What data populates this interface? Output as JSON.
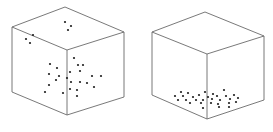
{
  "figure": {
    "background": "#ffffff",
    "edge_color": "#6a6a6a",
    "dot_color": "#1e1e1e",
    "dot_radius": 1.1,
    "panels": [
      {
        "id": "dispersed",
        "label": "",
        "cube": {
          "top_back": [
            65,
            7
          ],
          "left_top": [
            12,
            27
          ],
          "right_top": [
            124,
            32
          ],
          "front_top": [
            67,
            50
          ],
          "left_bottom": [
            12,
            92
          ],
          "front_bottom": [
            67,
            115
          ],
          "right_bottom": [
            124,
            97
          ]
        },
        "dots": [
          [
            65,
            22
          ],
          [
            71,
            26
          ],
          [
            68,
            30
          ],
          [
            33,
            35
          ],
          [
            26,
            39
          ],
          [
            30,
            43
          ],
          [
            74,
            58
          ],
          [
            50,
            64
          ],
          [
            78,
            65
          ],
          [
            83,
            65
          ],
          [
            57,
            68
          ],
          [
            49,
            74
          ],
          [
            70,
            72
          ],
          [
            80,
            71
          ],
          [
            59,
            76
          ],
          [
            67,
            78
          ],
          [
            56,
            80
          ],
          [
            92,
            76
          ],
          [
            101,
            76
          ],
          [
            71,
            82
          ],
          [
            80,
            82
          ],
          [
            87,
            83
          ],
          [
            49,
            85
          ],
          [
            94,
            87
          ],
          [
            70,
            89
          ],
          [
            77,
            90
          ],
          [
            45,
            92
          ],
          [
            63,
            93
          ],
          [
            77,
            96
          ]
        ]
      },
      {
        "id": "settled",
        "label": "",
        "cube": {
          "top_back": [
            205,
            12
          ],
          "left_top": [
            152,
            32
          ],
          "right_top": [
            264,
            36
          ],
          "front_top": [
            207,
            54
          ],
          "left_bottom": [
            152,
            95
          ],
          "front_bottom": [
            207,
            119
          ],
          "right_bottom": [
            264,
            100
          ]
        },
        "dots": [
          [
            181,
            92
          ],
          [
            188,
            93
          ],
          [
            205,
            92
          ],
          [
            224,
            90
          ],
          [
            213,
            94
          ],
          [
            175,
            96
          ],
          [
            183,
            96
          ],
          [
            193,
            97
          ],
          [
            199,
            95
          ],
          [
            208,
            97
          ],
          [
            217,
            96
          ],
          [
            226,
            96
          ],
          [
            234,
            95
          ],
          [
            178,
            100
          ],
          [
            186,
            100
          ],
          [
            196,
            100
          ],
          [
            203,
            100
          ],
          [
            212,
            99
          ],
          [
            220,
            100
          ],
          [
            230,
            99
          ],
          [
            238,
            98
          ],
          [
            190,
            103
          ],
          [
            201,
            103
          ],
          [
            211,
            103
          ],
          [
            218,
            104
          ],
          [
            229,
            103
          ],
          [
            236,
            102
          ],
          [
            203,
            108
          ],
          [
            219,
            107
          ],
          [
            229,
            107
          ]
        ]
      }
    ]
  }
}
